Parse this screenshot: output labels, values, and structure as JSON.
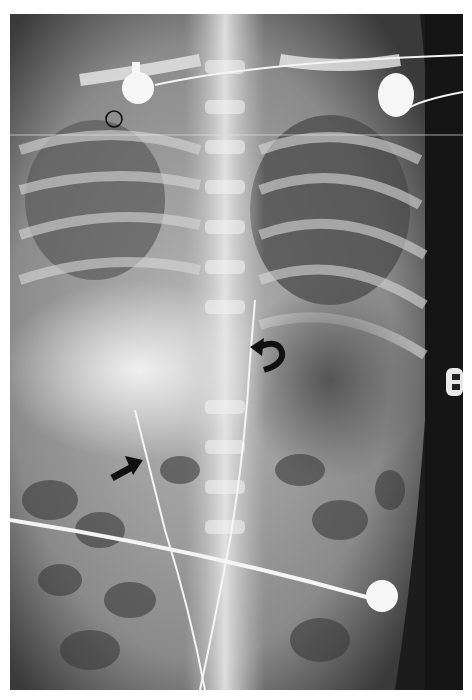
{
  "image": {
    "type": "radiograph",
    "view": "frontal chest-abdomen (infant)",
    "background": "#ffffff",
    "film_tone_dark": "#1a1a1a",
    "film_tone_bright": "#f2f2f2"
  },
  "annotations": [
    {
      "kind": "open-circle",
      "x": 114,
      "y": 119,
      "r": 8,
      "color": "#111111"
    },
    {
      "kind": "curved-arrow",
      "x": 268,
      "y": 355,
      "color": "#111111",
      "direction": "pointing-left-up"
    },
    {
      "kind": "straight-arrow",
      "x": 128,
      "y": 465,
      "color": "#111111",
      "direction": "pointing-up-right"
    }
  ],
  "devices": [
    {
      "kind": "ecg-electrode",
      "x": 137,
      "y": 88
    },
    {
      "kind": "ecg-electrode",
      "x": 395,
      "y": 95
    },
    {
      "kind": "ecg-electrode",
      "x": 382,
      "y": 596
    },
    {
      "kind": "side-clip",
      "x": 455,
      "y": 380
    },
    {
      "kind": "catheter-line",
      "label": "umbilical/nasogastric line"
    }
  ]
}
